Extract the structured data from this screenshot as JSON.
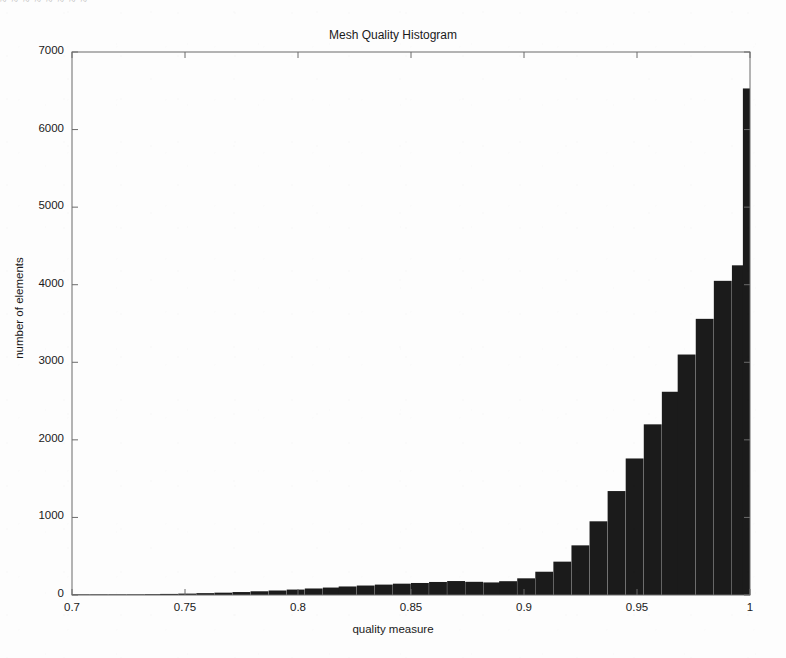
{
  "document": {
    "scan_artifact_top": "~ ~ ~ ~ ~ ~ ~ ~",
    "background_color": "#fdfdfd"
  },
  "chart_data": {
    "type": "bar",
    "subtype": "histogram",
    "title": "Mesh Quality Histogram",
    "xlabel": "quality measure",
    "ylabel": "number of elements",
    "xlim": [
      0.7,
      1.0
    ],
    "ylim": [
      0,
      7000
    ],
    "xticks": [
      0.7,
      0.75,
      0.8,
      0.85,
      0.9,
      0.95,
      1.0
    ],
    "xtick_labels": [
      "0.7",
      "0.75",
      "0.8",
      "0.85",
      "0.9",
      "0.95",
      "1"
    ],
    "yticks": [
      0,
      1000,
      2000,
      3000,
      4000,
      5000,
      6000,
      7000
    ],
    "ytick_labels": [
      "0",
      "1000",
      "2000",
      "3000",
      "4000",
      "5000",
      "6000",
      "7000"
    ],
    "grid": false,
    "legend": null,
    "bar_color": "#1b1b1b",
    "axis_color": "#6b6b6b",
    "bin_width": 0.00789,
    "bin_left_edges": [
      0.7,
      0.708,
      0.716,
      0.724,
      0.732,
      0.739,
      0.747,
      0.755,
      0.763,
      0.771,
      0.779,
      0.787,
      0.795,
      0.803,
      0.811,
      0.818,
      0.826,
      0.834,
      0.842,
      0.85,
      0.858,
      0.866,
      0.874,
      0.882,
      0.889,
      0.897,
      0.905,
      0.913,
      0.921,
      0.929,
      0.937,
      0.945,
      0.953,
      0.961,
      0.968,
      0.976,
      0.984,
      0.992
    ],
    "categories": [
      "0.700",
      "0.708",
      "0.716",
      "0.724",
      "0.732",
      "0.739",
      "0.747",
      "0.755",
      "0.763",
      "0.771",
      "0.779",
      "0.787",
      "0.795",
      "0.803",
      "0.811",
      "0.818",
      "0.826",
      "0.834",
      "0.842",
      "0.850",
      "0.858",
      "0.866",
      "0.874",
      "0.882",
      "0.889",
      "0.897",
      "0.905",
      "0.913",
      "0.921",
      "0.929",
      "0.937",
      "0.945",
      "0.953",
      "0.961",
      "0.968",
      "0.976",
      "0.984",
      "0.992"
    ],
    "values": [
      2,
      4,
      5,
      8,
      10,
      14,
      18,
      24,
      30,
      38,
      48,
      58,
      70,
      84,
      96,
      110,
      122,
      134,
      146,
      155,
      168,
      180,
      170,
      162,
      178,
      215,
      300,
      430,
      640,
      950,
      1340,
      1760,
      2200,
      2620,
      3100,
      3560,
      4050,
      4250
    ],
    "spike": {
      "x": 1.0,
      "value": 6530,
      "width_fraction": 0.0105,
      "note": "narrow spike at quality measure = 1"
    }
  }
}
